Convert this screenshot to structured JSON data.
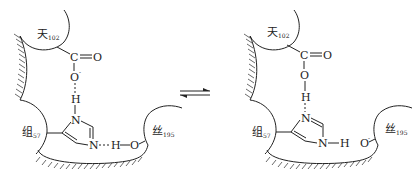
{
  "diagram": {
    "type": "chemical-equilibrium",
    "equilibrium_symbol": "⇌",
    "left_state": {
      "residues": {
        "asp": {
          "name": "天",
          "number": "102"
        },
        "his": {
          "name": "组",
          "number": "57"
        },
        "ser": {
          "name": "丝",
          "number": "195"
        }
      },
      "atoms": {
        "carboxyl_c": "C",
        "carbonyl_o": "O",
        "carboxylate_o": "O",
        "carboxylate_charge": "-",
        "h_bridge_top": "H",
        "n_top": "N",
        "n_bottom": "N",
        "h_bridge_ser": "H",
        "ser_o": "O"
      }
    },
    "right_state": {
      "residues": {
        "asp": {
          "name": "天",
          "number": "102"
        },
        "his": {
          "name": "组",
          "number": "57"
        },
        "ser": {
          "name": "丝",
          "number": "195"
        }
      },
      "atoms": {
        "carboxyl_c": "C",
        "carbonyl_o": "O",
        "hydroxyl_o": "O",
        "h_top": "H",
        "n_top": "N",
        "n_bottom": "N",
        "h_nh": "H",
        "ser_o": "O",
        "ser_charge": "-"
      }
    }
  }
}
